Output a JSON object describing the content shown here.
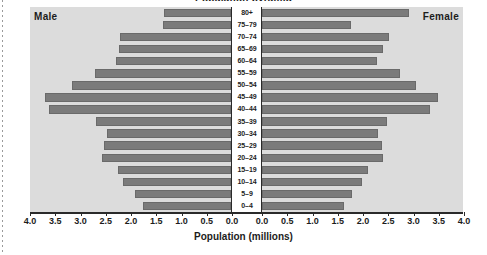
{
  "chart_data": {
    "type": "bar",
    "subtype": "population-pyramid",
    "title": "Population pyramid",
    "xlabel": "Population (millions)",
    "ylabel": "",
    "categories": [
      "80+",
      "75–79",
      "70–74",
      "65–69",
      "60–64",
      "55–59",
      "50–54",
      "45–49",
      "40–44",
      "35–39",
      "30–34",
      "25–29",
      "20–24",
      "15–19",
      "10–14",
      "5–9",
      "0–4"
    ],
    "series": [
      {
        "name": "Male",
        "side": "left",
        "values": [
          1.33,
          1.35,
          2.2,
          2.22,
          2.28,
          2.7,
          3.15,
          3.68,
          3.6,
          2.67,
          2.45,
          2.52,
          2.55,
          2.23,
          2.13,
          1.9,
          1.75
        ]
      },
      {
        "name": "Female",
        "side": "right",
        "values": [
          2.92,
          1.77,
          2.52,
          2.4,
          2.28,
          2.73,
          3.05,
          3.48,
          3.33,
          2.48,
          2.3,
          2.38,
          2.4,
          2.1,
          1.98,
          1.78,
          1.63
        ]
      }
    ],
    "xticks_left": [
      "4.0",
      "3.5",
      "3.0",
      "2.5",
      "2.0",
      "1.5",
      "1.0",
      "0.5",
      "0.0"
    ],
    "xticks_right": [
      "0.0",
      "0.5",
      "1.0",
      "1.5",
      "2.0",
      "2.5",
      "3.0",
      "3.5",
      "4.0"
    ],
    "xlim": [
      0,
      4.0
    ],
    "grid": false,
    "legend_position": "inside-corners",
    "colors": {
      "bar": "#7b7b7b",
      "bar_border": "#6a6a6a",
      "plot_background": "#dcdcdc",
      "page_background": "#ffffff",
      "axis": "#2a2a2a",
      "text": "#1c1c1c"
    }
  },
  "labels": {
    "male": "Male",
    "female": "Female"
  }
}
